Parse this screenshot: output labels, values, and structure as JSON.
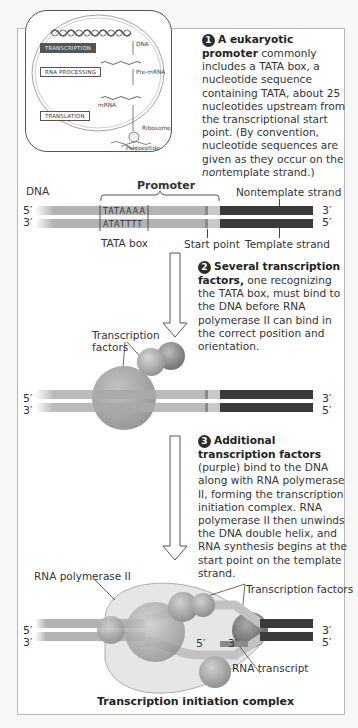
{
  "inset": {
    "transcription": "TRANSCRIPTION",
    "rna_processing": "RNA PROCESSING",
    "translation": "TRANSLATION",
    "dna": "DNA",
    "pre_mrna": "Pre-mRNA",
    "mrna": "mRNA",
    "ribosome": "Ribosome",
    "polypeptide": "Polypeptide"
  },
  "step1": {
    "number": "1",
    "bold": "A eukaryotic promoter",
    "text_a": " commonly includes a TATA box, a nucleotide sequence containing TATA, about 25 nucleotides upstream from the transcriptional start point. (By convention, nucleotide sequences are given as they occur on the ",
    "italic": "non",
    "text_b": "template strand.)"
  },
  "row1": {
    "promoter": "Promoter",
    "dna": "DNA",
    "nontemplate": "Nontemplate strand",
    "template": "Template strand",
    "tata_box": "TATA box",
    "start_point": "Start point",
    "seq_top": "TATAAAA",
    "seq_bottom": "ATATTTT",
    "left_top": "5′",
    "left_bottom": "3′",
    "right_top": "3′",
    "right_bottom": "5′"
  },
  "step2": {
    "number": "2",
    "bold": "Several transcription factors,",
    "text": " one recognizing the TATA box, must bind to the DNA before RNA polymerase II can bind in the correct position and orientation."
  },
  "row2": {
    "tf_label_1": "Transcription",
    "tf_label_2": "factors",
    "left_top": "5′",
    "left_bottom": "3′",
    "right_top": "3′",
    "right_bottom": "5′"
  },
  "step3": {
    "number": "3",
    "bold": "Additional transcription factors",
    "text": " (purple) bind to the DNA along with RNA polymerase II, forming the transcription initiation complex. RNA polymerase II then unwinds the DNA double helix, and RNA synthesis begins at the start point on the template strand."
  },
  "row3": {
    "rna_pol": "RNA polymerase II",
    "tf": "Transcription factors",
    "rna_transcript": "RNA transcript",
    "transcript_5": "5′",
    "transcript_3": "3′",
    "left_top": "5′",
    "left_bottom": "3′",
    "right_top": "3′",
    "right_bottom": "5′",
    "caption": "Transcription initiation complex"
  },
  "colors": {
    "strand_light": "#b3b3b3",
    "strand_dark": "#3a3a3a",
    "sphere": "#a9a9a9",
    "panel_border": "#b9b9b9"
  }
}
